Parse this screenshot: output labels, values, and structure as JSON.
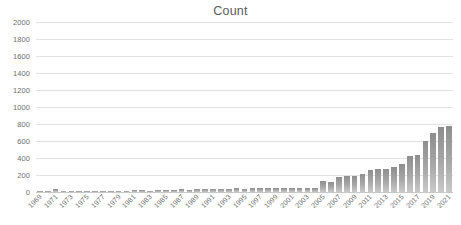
{
  "chart_data": {
    "type": "bar",
    "title": "Count",
    "xlabel": "",
    "ylabel": "",
    "ylim": [
      0,
      2000
    ],
    "ytick_step": 200,
    "yticks": [
      0,
      200,
      400,
      600,
      800,
      1000,
      1200,
      1400,
      1600,
      1800,
      2000
    ],
    "grid": true,
    "legend": "none",
    "xtick_interval_years": 2,
    "xtick_labels": [
      "1969",
      "1971",
      "1973",
      "1975",
      "1977",
      "1979",
      "1981",
      "1983",
      "1985",
      "1987",
      "1989",
      "1991",
      "1993",
      "1995",
      "1997",
      "1999",
      "2001",
      "2003",
      "2005",
      "2007",
      "2009",
      "2011",
      "2013",
      "2015",
      "2017",
      "2019",
      "2021"
    ],
    "xtick_rotation_deg": -45,
    "bar_color": "#9d9d9d",
    "grid_color": "#e2e2e2",
    "text_color": "#6e6e6e",
    "categories": [
      "1969",
      "1970",
      "1971",
      "1972",
      "1973",
      "1974",
      "1975",
      "1976",
      "1977",
      "1978",
      "1979",
      "1980",
      "1981",
      "1982",
      "1983",
      "1984",
      "1985",
      "1986",
      "1987",
      "1988",
      "1989",
      "1990",
      "1991",
      "1992",
      "1993",
      "1994",
      "1995",
      "1996",
      "1997",
      "1998",
      "1999",
      "2000",
      "2001",
      "2002",
      "2003",
      "2004",
      "2005",
      "2006",
      "2007",
      "2008",
      "2009",
      "2010",
      "2011",
      "2012",
      "2013",
      "2014",
      "2015",
      "2016",
      "2017",
      "2018",
      "2019",
      "2020",
      "2021"
    ],
    "values": [
      12,
      10,
      30,
      14,
      8,
      7,
      6,
      8,
      10,
      9,
      14,
      16,
      18,
      20,
      16,
      18,
      22,
      26,
      30,
      24,
      30,
      40,
      34,
      40,
      38,
      42,
      32,
      44,
      50,
      46,
      44,
      48,
      42,
      44,
      46,
      50,
      130,
      120,
      175,
      185,
      190,
      215,
      255,
      265,
      275,
      300,
      330,
      420,
      440,
      600,
      690,
      760,
      780
    ]
  }
}
